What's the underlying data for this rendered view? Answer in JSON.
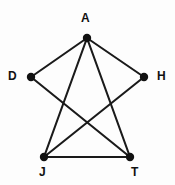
{
  "figure": {
    "kind": "undirected-graph-diagram",
    "background_color": "#fdfdfd",
    "edge_color": "#1a1a1a",
    "node_color": "#111111",
    "label_color": "#111111",
    "width": 175,
    "height": 185
  },
  "nodes": [
    {
      "id": "A",
      "label": "A",
      "x": 87,
      "y": 38,
      "r": 4.2,
      "label_x": 81,
      "label_y": 12
    },
    {
      "id": "D",
      "label": "D",
      "x": 31,
      "y": 77,
      "r": 4.2,
      "label_x": 8,
      "label_y": 70
    },
    {
      "id": "H",
      "label": "H",
      "x": 144,
      "y": 77,
      "r": 4.2,
      "label_x": 157,
      "label_y": 70
    },
    {
      "id": "J",
      "label": "J",
      "x": 44,
      "y": 157,
      "r": 4.2,
      "label_x": 39,
      "label_y": 166
    },
    {
      "id": "T",
      "label": "T",
      "x": 130,
      "y": 157,
      "r": 4.2,
      "label_x": 131,
      "label_y": 166
    }
  ],
  "edges": [
    {
      "from": "A",
      "to": "D"
    },
    {
      "from": "A",
      "to": "H"
    },
    {
      "from": "A",
      "to": "J"
    },
    {
      "from": "A",
      "to": "T"
    },
    {
      "from": "D",
      "to": "T"
    },
    {
      "from": "H",
      "to": "J"
    },
    {
      "from": "J",
      "to": "T"
    }
  ]
}
